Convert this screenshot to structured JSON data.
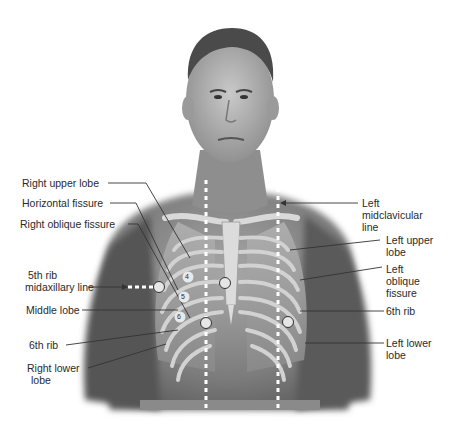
{
  "figure": {
    "colors": {
      "background": "#ffffff",
      "skin_dark": "#6e6e6e",
      "skin_mid": "#8f8f8f",
      "skin_light": "#bdbdbd",
      "bone": "#d8d8d8",
      "lung": "#9a9a9a",
      "leader_line": "#333333",
      "dotted_line": "#ffffff",
      "marker_fill": "#e6e6e6",
      "marker_stroke": "#333333"
    }
  },
  "labels": {
    "right_upper_lobe": "Right upper lobe",
    "horizontal_fissure": "Horizontal fissure",
    "right_oblique_fissure": "Right oblique fissure",
    "fifth_rib_midaxillary_line_1": "5th rib",
    "fifth_rib_midaxillary_line_2": "midaxillary line",
    "middle_lobe": "Middle lobe",
    "sixth_rib_right": "6th rib",
    "right_lower_lobe_1": "Right lower",
    "right_lower_lobe_2": "lobe",
    "left_midclavicular_line_1": "Left",
    "left_midclavicular_line_2": "midclavicular",
    "left_midclavicular_line_3": "line",
    "left_upper_lobe_1": "Left upper",
    "left_upper_lobe_2": "lobe",
    "left_oblique_fissure_1": "Left",
    "left_oblique_fissure_2": "oblique",
    "left_oblique_fissure_3": "fissure",
    "sixth_rib_left": "6th rib",
    "left_lower_lobe_1": "Left lower",
    "left_lower_lobe_2": "lobe"
  },
  "rib_numbers": [
    "4",
    "5",
    "6"
  ]
}
